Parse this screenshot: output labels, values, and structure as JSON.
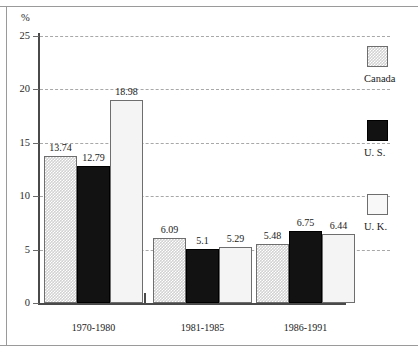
{
  "chart_data": {
    "type": "bar",
    "title": "",
    "subtitle": "",
    "xlabel": "",
    "ylabel": "%",
    "ylim": [
      0,
      26.5
    ],
    "yticks": [
      0,
      5,
      10,
      15,
      20,
      25
    ],
    "ytick_labels": [
      "0",
      "5",
      "10",
      "15",
      "20",
      "25"
    ],
    "grid": "horizontal-dashed",
    "legend_position": "right",
    "categories": [
      "1970-1980",
      "1981-1985",
      "1986-1991"
    ],
    "series": [
      {
        "name": "Canada",
        "values": [
          13.74,
          6.09,
          5.48
        ],
        "value_labels": [
          "13.74",
          "6.09",
          "5.48"
        ],
        "style": "checkered-gray"
      },
      {
        "name": "U. S.",
        "values": [
          12.79,
          5.1,
          6.75
        ],
        "value_labels": [
          "12.79",
          "5.1",
          "6.75"
        ],
        "style": "solid-black"
      },
      {
        "name": "U. K.",
        "values": [
          18.98,
          5.29,
          6.44
        ],
        "value_labels": [
          "18.98",
          "5.29",
          "6.44"
        ],
        "style": "white"
      }
    ]
  },
  "axis": {
    "unit_label": "%"
  },
  "legend": {
    "entries": [
      {
        "label": "Canada"
      },
      {
        "label": "U. S."
      },
      {
        "label": "U. K."
      }
    ]
  },
  "colors": {
    "canada_fill": "#d2d2d2",
    "us_fill": "#121212",
    "uk_fill": "#f4f4f4",
    "gridline": "#a8a8a8",
    "axis": "#4a4a4a",
    "frame": "#9a9a9a"
  }
}
